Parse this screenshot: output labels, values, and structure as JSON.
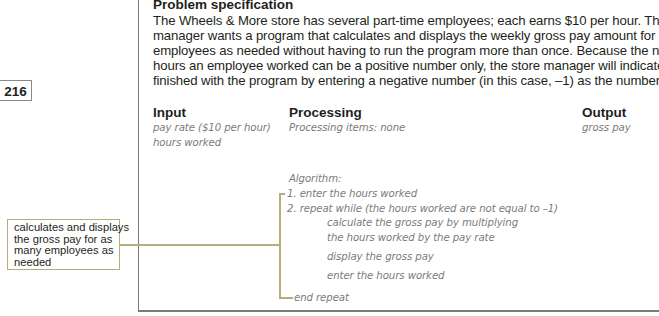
{
  "page_number": "216",
  "problem_specification": {
    "title": "Problem specification",
    "lines": [
      "The Wheels & More store has several part-time employees; each earns $10 per hour. The store",
      "manager wants a program that calculates and displays the weekly gross pay amount for as many",
      "employees as needed without having to run the program more than once. Because the number of",
      "hours an employee worked can be a positive number only, the store manager will indicate that he is",
      "finished with the program by entering a negative number (in this case, –1) as the number of hours."
    ]
  },
  "ipo_chart": {
    "input": {
      "heading": "Input",
      "items": [
        "pay rate ($10 per hour)",
        "hours worked"
      ]
    },
    "processing": {
      "heading": "Processing",
      "items_label": "Processing items: none",
      "algorithm_label": "Algorithm:",
      "steps": [
        "1. enter the hours worked",
        "2. repeat while (the hours worked are not equal to –1)",
        "calculate the gross pay by multiplying",
        "the hours worked by the pay rate",
        "display the gross pay",
        "enter the hours worked",
        "end repeat"
      ]
    },
    "output": {
      "heading": "Output",
      "items": [
        "gross pay"
      ]
    }
  },
  "callout": {
    "lines": [
      "calculates and displays",
      "the gross pay for as",
      "many employees as",
      "needed"
    ]
  },
  "colors": {
    "callout_border": "#b5ad7a",
    "frame": "#7a7a7a",
    "handwriting": "#7d7b78"
  }
}
